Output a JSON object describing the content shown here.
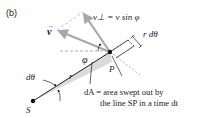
{
  "figure": {
    "panel_label": "(b)",
    "vectors": {
      "velocity_label": "v",
      "perp_label": "v⊥ = v sin φ"
    },
    "angle_phi": "φ",
    "arc_label": "r dθ",
    "radius_label": "r",
    "dtheta_label": "dθ",
    "point_P": "P",
    "point_S": "S",
    "area_label_line1": "dA = area swept out by",
    "area_label_line2": "the line SP in a time dt",
    "colors": {
      "arrow_gray": "#a8a8a8",
      "shade_gray": "#d6d6d6",
      "line": "#222222",
      "dash": "#9a9a9a"
    }
  }
}
